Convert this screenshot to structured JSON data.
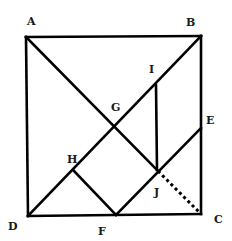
{
  "diagram": {
    "type": "geometry-tangram-square",
    "stroke_color": "#000000",
    "background": "#ffffff",
    "points": {
      "A": {
        "x": 26,
        "y": 37
      },
      "B": {
        "x": 201,
        "y": 36
      },
      "C": {
        "x": 201,
        "y": 214
      },
      "D": {
        "x": 28,
        "y": 216
      },
      "E": {
        "x": 201,
        "y": 128
      },
      "F": {
        "x": 116,
        "y": 215
      },
      "G": {
        "x": 115,
        "y": 126
      },
      "H": {
        "x": 73,
        "y": 170
      },
      "I": {
        "x": 156,
        "y": 85
      },
      "J": {
        "x": 157,
        "y": 170
      }
    },
    "labels": [
      {
        "id": "A",
        "text": "A",
        "x": 27,
        "y": 25
      },
      {
        "id": "B",
        "text": "B",
        "x": 186,
        "y": 26
      },
      {
        "id": "I",
        "text": "I",
        "x": 149,
        "y": 73
      },
      {
        "id": "G",
        "text": "G",
        "x": 111,
        "y": 111
      },
      {
        "id": "E",
        "text": "E",
        "x": 206,
        "y": 124
      },
      {
        "id": "H",
        "text": "H",
        "x": 67,
        "y": 163
      },
      {
        "id": "J",
        "text": "J",
        "x": 154,
        "y": 196
      },
      {
        "id": "D",
        "text": "D",
        "x": 8,
        "y": 230
      },
      {
        "id": "F",
        "text": "F",
        "x": 98,
        "y": 235
      },
      {
        "id": "C",
        "text": "C",
        "x": 214,
        "y": 223
      }
    ],
    "segments_solid": [
      [
        "A",
        "B"
      ],
      [
        "B",
        "C"
      ],
      [
        "C",
        "D"
      ],
      [
        "D",
        "A"
      ],
      [
        "A",
        "J"
      ],
      [
        "D",
        "B"
      ],
      [
        "I",
        "J"
      ],
      [
        "H",
        "F"
      ],
      [
        "F",
        "E"
      ]
    ],
    "segments_dashed": [
      [
        "J",
        "C"
      ]
    ]
  }
}
